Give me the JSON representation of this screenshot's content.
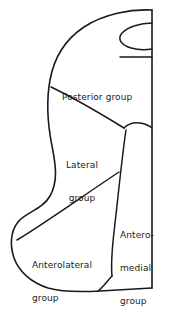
{
  "figure": {
    "background_color": "#ffffff",
    "stroke_color": "#1a1a1a",
    "text_color": "#1a1a1a"
  },
  "labels": {
    "posterior": {
      "lines": [
        "Posterior group"
      ],
      "full_text": "Posterior group"
    },
    "lateral": {
      "lines": [
        "Lateral",
        "group"
      ],
      "full_text": "Lateral group"
    },
    "anterolateral": {
      "lines": [
        "Anterolateral",
        "group"
      ],
      "full_text": "Anterolateral group"
    },
    "anteromedial": {
      "lines": [
        "Antero-",
        "medial",
        "group"
      ],
      "full_text": "Anteromedial group"
    }
  },
  "regions": [
    {
      "name": "posterior-group",
      "label": "Posterior group"
    },
    {
      "name": "lateral-group",
      "label": "Lateral group"
    },
    {
      "name": "anterolateral-group",
      "label": "Anterolateral group"
    },
    {
      "name": "anteromedial-group",
      "label": "Anteromedial group"
    }
  ]
}
